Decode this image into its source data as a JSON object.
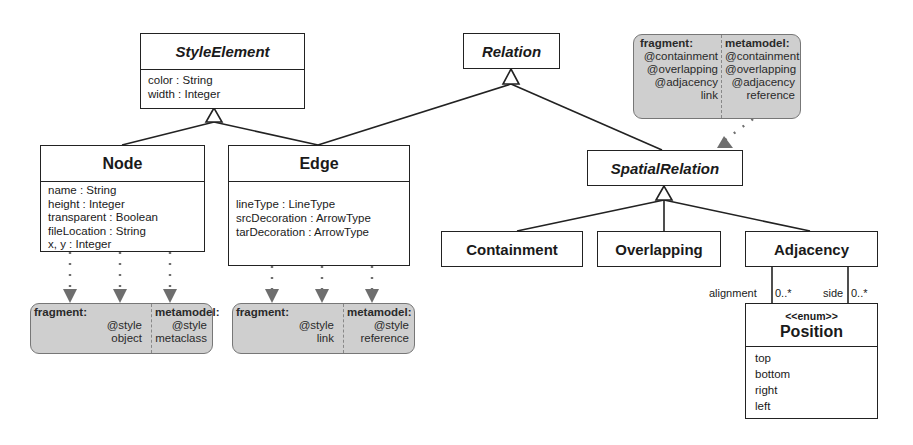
{
  "classes": {
    "style_element": {
      "name": "StyleElement",
      "attributes": [
        "color : String",
        "width : Integer"
      ]
    },
    "relation": {
      "name": "Relation"
    },
    "node": {
      "name": "Node",
      "attributes": [
        "name : String",
        "height : Integer",
        "transparent : Boolean",
        "fileLocation : String",
        "x, y : Integer"
      ]
    },
    "edge": {
      "name": "Edge",
      "attributes": [
        "lineType : LineType",
        "srcDecoration : ArrowType",
        "tarDecoration : ArrowType"
      ]
    },
    "spatial_relation": {
      "name": "SpatialRelation"
    },
    "containment": {
      "name": "Containment"
    },
    "overlapping": {
      "name": "Overlapping"
    },
    "adjacency": {
      "name": "Adjacency"
    },
    "position": {
      "stereotype": "<<enum>>",
      "name": "Position",
      "literals": [
        "top",
        "bottom",
        "right",
        "left"
      ]
    }
  },
  "annotations": {
    "node_note": {
      "fragment": {
        "label": "fragment:",
        "values": [
          "@style",
          "object"
        ]
      },
      "metamodel": {
        "label": "metamodel:",
        "values": [
          "@style",
          "metaclass"
        ]
      }
    },
    "edge_note": {
      "fragment": {
        "label": "fragment:",
        "values": [
          "@style",
          "link"
        ]
      },
      "metamodel": {
        "label": "metamodel:",
        "values": [
          "@style",
          "reference"
        ]
      }
    },
    "relation_note": {
      "fragment": {
        "label": "fragment:",
        "values": [
          "@containment",
          "@overlapping",
          "@adjacency",
          "link"
        ]
      },
      "metamodel": {
        "label": "metamodel:",
        "values": [
          "@containment",
          "@overlapping",
          "@adjacency",
          "reference"
        ]
      }
    }
  },
  "associations": {
    "alignment": {
      "role": "alignment",
      "multiplicity": "0..*"
    },
    "side": {
      "role": "side",
      "multiplicity": "0..*"
    }
  },
  "colors": {
    "note_fill": "#cfcfcf",
    "note_arrow": "#6e6e6e",
    "line": "#222222"
  }
}
